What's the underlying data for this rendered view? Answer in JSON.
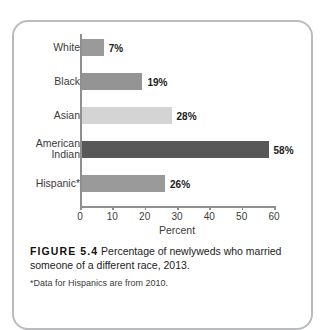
{
  "chart_data": {
    "type": "bar",
    "orientation": "horizontal",
    "categories": [
      "White",
      "Black",
      "Asian",
      "American\nIndian",
      "Hispanic*"
    ],
    "values": [
      7,
      19,
      28,
      58,
      26
    ],
    "value_labels": [
      "7%",
      "19%",
      "28%",
      "58%",
      "26%"
    ],
    "bar_colors": [
      "#9a9a9a",
      "#949494",
      "#d4d4d4",
      "#585858",
      "#9a9a9a"
    ],
    "title": "",
    "xlabel": "Percent",
    "ylabel": "",
    "xlim": [
      0,
      60
    ],
    "xticks": [
      0,
      10,
      20,
      30,
      40,
      50,
      60
    ],
    "xtick_labels": [
      "0",
      "10",
      "20",
      "30",
      "40",
      "50",
      "60"
    ],
    "grid": false,
    "legend": "none"
  },
  "figure": {
    "tag": "FIGURE 5.4",
    "caption": " Percentage of newlyweds who married someone of a different race, 2013.",
    "footnote": "*Data for Hispanics are from 2010."
  }
}
